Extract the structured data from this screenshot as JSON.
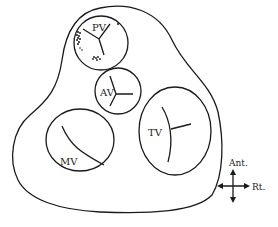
{
  "diagram": {
    "type": "cardiac valve cross-section (base of heart)",
    "valves": [
      {
        "id": "pv",
        "label": "PV"
      },
      {
        "id": "av",
        "label": "AV"
      },
      {
        "id": "mv",
        "label": "MV"
      },
      {
        "id": "tv",
        "label": "TV"
      }
    ],
    "orientation": {
      "up_label": "Ant.",
      "right_label": "Rt."
    },
    "colors": {
      "line": "#1a1a1a",
      "background": "#ffffff"
    }
  }
}
